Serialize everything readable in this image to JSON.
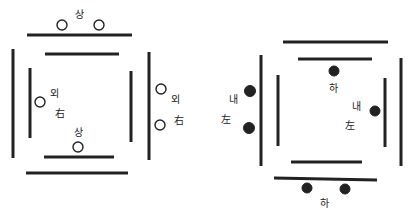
{
  "diagram": {
    "left_figure": {
      "labels": {
        "top": "상",
        "left_outer": "외",
        "left_inner": "右",
        "bottom_inner": "상",
        "right_outer": "외",
        "right_inner": "右"
      },
      "marker_style": "open-circle"
    },
    "right_figure": {
      "labels": {
        "top_inner": "하",
        "left_outer": "내",
        "left_inner": "左",
        "right_outer": "내",
        "right_inner": "左",
        "bottom": "하"
      },
      "marker_style": "filled-circle"
    }
  }
}
